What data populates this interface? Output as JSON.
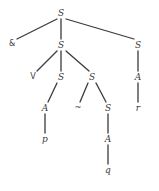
{
  "figure": {
    "background_color": "#ffffff",
    "line_color": "#3a3a3a",
    "text_color": "#3a3a3a",
    "width": 159,
    "height": 191
  },
  "nodes": [
    {
      "id": "n0",
      "label": "S",
      "kind": "nonterminal",
      "x": 61,
      "y": 13
    },
    {
      "id": "n1",
      "label": "&",
      "kind": "symbol",
      "x": 12,
      "y": 44
    },
    {
      "id": "n2",
      "label": "S",
      "kind": "nonterminal",
      "x": 61,
      "y": 45
    },
    {
      "id": "n3",
      "label": "S",
      "kind": "nonterminal",
      "x": 138,
      "y": 45
    },
    {
      "id": "n4",
      "label": "V",
      "kind": "symbol",
      "x": 33,
      "y": 77
    },
    {
      "id": "n5",
      "label": "S",
      "kind": "nonterminal",
      "x": 61,
      "y": 77
    },
    {
      "id": "n6",
      "label": "S",
      "kind": "nonterminal",
      "x": 92,
      "y": 77
    },
    {
      "id": "n7",
      "label": "A",
      "kind": "nonterminal",
      "x": 138,
      "y": 77
    },
    {
      "id": "n8",
      "label": "A",
      "kind": "nonterminal",
      "x": 45,
      "y": 108
    },
    {
      "id": "n9",
      "label": "~",
      "kind": "symbol",
      "x": 78,
      "y": 108
    },
    {
      "id": "n10",
      "label": "S",
      "kind": "nonterminal",
      "x": 108,
      "y": 108
    },
    {
      "id": "n11",
      "label": "r",
      "kind": "terminal",
      "x": 138,
      "y": 108
    },
    {
      "id": "n12",
      "label": "p",
      "kind": "terminal",
      "x": 45,
      "y": 139
    },
    {
      "id": "n13",
      "label": "A",
      "kind": "nonterminal",
      "x": 108,
      "y": 139
    },
    {
      "id": "n14",
      "label": "q",
      "kind": "terminal",
      "x": 108,
      "y": 170
    }
  ],
  "edges": [
    {
      "from": "n0",
      "to": "n1",
      "x1": 57,
      "y1": 19,
      "x2": 17,
      "y2": 39
    },
    {
      "from": "n0",
      "to": "n2",
      "x1": 61,
      "y1": 19,
      "x2": 61,
      "y2": 39
    },
    {
      "from": "n0",
      "to": "n3",
      "x1": 66,
      "y1": 19,
      "x2": 134,
      "y2": 39
    },
    {
      "from": "n2",
      "to": "n4",
      "x1": 57,
      "y1": 51,
      "x2": 37,
      "y2": 71
    },
    {
      "from": "n2",
      "to": "n5",
      "x1": 61,
      "y1": 51,
      "x2": 61,
      "y2": 71
    },
    {
      "from": "n2",
      "to": "n6",
      "x1": 66,
      "y1": 51,
      "x2": 89,
      "y2": 71
    },
    {
      "from": "n3",
      "to": "n7",
      "x1": 138,
      "y1": 51,
      "x2": 138,
      "y2": 71
    },
    {
      "from": "n5",
      "to": "n8",
      "x1": 57,
      "y1": 83,
      "x2": 48,
      "y2": 102
    },
    {
      "from": "n6",
      "to": "n9",
      "x1": 88,
      "y1": 83,
      "x2": 80,
      "y2": 102
    },
    {
      "from": "n6",
      "to": "n10",
      "x1": 96,
      "y1": 83,
      "x2": 106,
      "y2": 102
    },
    {
      "from": "n7",
      "to": "n11",
      "x1": 138,
      "y1": 83,
      "x2": 138,
      "y2": 102
    },
    {
      "from": "n8",
      "to": "n12",
      "x1": 45,
      "y1": 114,
      "x2": 45,
      "y2": 133
    },
    {
      "from": "n10",
      "to": "n13",
      "x1": 108,
      "y1": 114,
      "x2": 108,
      "y2": 133
    },
    {
      "from": "n13",
      "to": "n14",
      "x1": 108,
      "y1": 145,
      "x2": 108,
      "y2": 164
    }
  ]
}
